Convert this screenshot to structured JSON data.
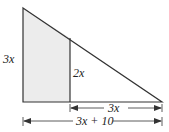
{
  "diagram": {
    "type": "right-triangle-with-shaded-trapezoid",
    "colors": {
      "stroke": "#333333",
      "shade": "#ececec",
      "background": "#ffffff"
    },
    "labels": {
      "left_height": "3x",
      "inner_height": "2x",
      "right_base_segment": "3x",
      "full_base": "3x + 10"
    },
    "points": {
      "top_left": [
        23,
        8
      ],
      "bottom_left": [
        23,
        102
      ],
      "bottom_right": [
        162,
        102
      ],
      "divider_top": [
        70,
        38
      ],
      "divider_bottom": [
        70,
        102
      ]
    }
  }
}
